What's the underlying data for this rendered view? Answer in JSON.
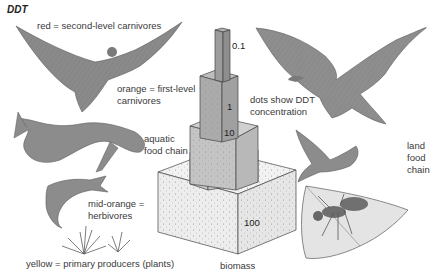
{
  "title": "DDT",
  "labels": {
    "red": "red = second-level carnivores",
    "orange_1": "orange = first-level",
    "orange_2": "carnivores",
    "aquatic_1": "aquatic",
    "aquatic_2": "food chain",
    "mid_orange_1": "mid-orange =",
    "mid_orange_2": "herbivores",
    "yellow": "yellow = primary producers (plants)",
    "dots_1": "dots show DDT",
    "dots_2": "concentration",
    "land_1": "land",
    "land_2": "food",
    "land_3": "chain",
    "biomass": "biomass"
  },
  "pyramid": {
    "levels": [
      {
        "value": "100",
        "color": "#ececec"
      },
      {
        "value": "10",
        "color": "#c9c9c9"
      },
      {
        "value": "1",
        "color": "#b0b0b0"
      },
      {
        "value": "0.1",
        "color": "#9e9e9e"
      }
    ]
  },
  "illustrations": [
    "osprey",
    "large-fish",
    "small-fish",
    "aquatic-plants",
    "eagle",
    "songbird",
    "ant-on-leaf"
  ]
}
